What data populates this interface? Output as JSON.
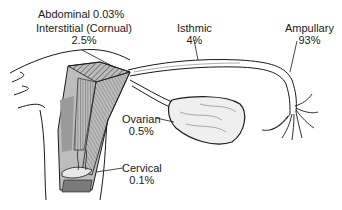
{
  "diagram": {
    "labels": {
      "abdominal": {
        "name": "Abdominal",
        "percent": "0.03%",
        "full": "Abdominal 0.03%"
      },
      "interstitial": {
        "name": "Interstitial (Cornual)",
        "percent": "2.5%"
      },
      "isthmic": {
        "name": "Isthmic",
        "percent": "4%"
      },
      "ampullary": {
        "name": "Ampullary",
        "percent": "93%"
      },
      "ovarian": {
        "name": "Ovarian",
        "percent": "0.5%"
      },
      "cervical": {
        "name": "Cervical",
        "percent": "0.1%"
      }
    },
    "colors": {
      "ink": "#1a1a1a",
      "shade": "#8a8a8a",
      "dark_shade": "#5a5a5a",
      "background": "#ffffff"
    }
  }
}
